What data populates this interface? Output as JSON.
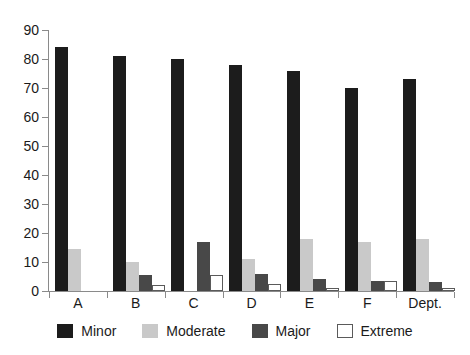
{
  "chart_data": {
    "type": "bar",
    "title": "",
    "xlabel": "",
    "ylabel": "",
    "ylim": [
      0,
      90
    ],
    "yticks": [
      0,
      10,
      20,
      30,
      40,
      50,
      60,
      70,
      80,
      90
    ],
    "grid": false,
    "legend_position": "bottom",
    "categories": [
      "A",
      "B",
      "C",
      "D",
      "E",
      "F",
      "Dept."
    ],
    "series": [
      {
        "name": "Minor",
        "color": "#1c1c1c",
        "values": [
          84,
          81,
          80,
          78,
          76,
          70,
          73
        ]
      },
      {
        "name": "Moderate",
        "color": "#c9c9c9",
        "values": [
          14.5,
          10,
          0,
          11,
          18,
          17,
          18
        ]
      },
      {
        "name": "Major",
        "color": "#484848",
        "values": [
          0,
          5.5,
          17,
          6,
          4,
          3.5,
          3
        ]
      },
      {
        "name": "Extreme",
        "color": "#ffffff",
        "values": [
          0,
          2,
          5.5,
          2.5,
          1,
          3.5,
          1
        ]
      }
    ]
  },
  "axis": {
    "y_labels": [
      "90",
      "80",
      "70",
      "60",
      "50",
      "40",
      "30",
      "20",
      "10",
      "0"
    ]
  },
  "legend": {
    "items": [
      {
        "label": "Minor"
      },
      {
        "label": "Moderate"
      },
      {
        "label": "Major"
      },
      {
        "label": "Extreme"
      }
    ]
  }
}
